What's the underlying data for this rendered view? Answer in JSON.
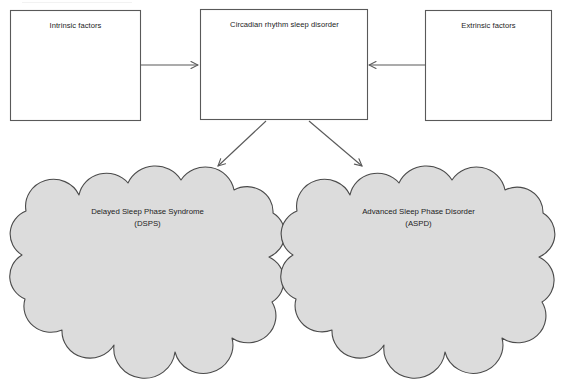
{
  "diagram": {
    "background_color": "#ffffff",
    "stroke_color": "#595959",
    "text_color": "#1c1c1c",
    "cloud_fill_color": "#dcdcdc",
    "boxes": [
      {
        "id": "intrinsic-factors",
        "label": "Intrinsic factors",
        "shape": "rectangle",
        "fill": "#ffffff"
      },
      {
        "id": "circadian-rhythm-sleep-disorder",
        "label": "Circadian rhythm sleep disorder",
        "shape": "rectangle",
        "fill": "#ffffff"
      },
      {
        "id": "extrinsic-factors",
        "label": "Extrinsic factors",
        "shape": "rectangle",
        "fill": "#ffffff"
      }
    ],
    "clouds": [
      {
        "id": "delayed-sleep-phase-syndrome",
        "line1": "Delayed Sleep Phase Syndrome",
        "line2": "(DSPS)",
        "shape": "cloud",
        "fill": "#dcdcdc"
      },
      {
        "id": "advanced-sleep-phase-disorder",
        "line1": "Advanced Sleep Phase Disorder",
        "line2": "(ASPD)",
        "shape": "cloud",
        "fill": "#dcdcdc"
      }
    ],
    "arrows": [
      {
        "id": "intrinsic-to-circadian",
        "from": "intrinsic-factors",
        "to": "circadian-rhythm-sleep-disorder",
        "direction": "right"
      },
      {
        "id": "extrinsic-to-circadian",
        "from": "extrinsic-factors",
        "to": "circadian-rhythm-sleep-disorder",
        "direction": "left"
      },
      {
        "id": "circadian-to-dsps",
        "from": "circadian-rhythm-sleep-disorder",
        "to": "delayed-sleep-phase-syndrome",
        "direction": "down-left"
      },
      {
        "id": "circadian-to-aspd",
        "from": "circadian-rhythm-sleep-disorder",
        "to": "advanced-sleep-phase-disorder",
        "direction": "down-right"
      }
    ]
  }
}
